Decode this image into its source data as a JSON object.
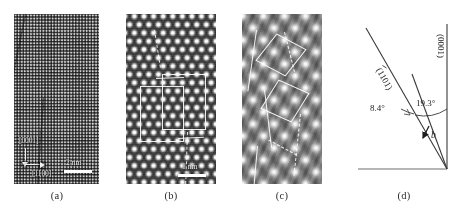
{
  "figure": {
    "panels": [
      {
        "id": "a",
        "caption": "(a)",
        "type": "hrtem-lattice-image",
        "annotations": {
          "direction_vertical": "[0001]",
          "direction_horizontal": "[1100]",
          "scalebar_label": "2 nm"
        }
      },
      {
        "id": "b",
        "caption": "(b)",
        "type": "hrtem-honeycomb-lattice-image",
        "annotations": {
          "scalebar_label": "1 nm"
        }
      },
      {
        "id": "c",
        "caption": "(c)",
        "type": "haadf-stem-atomic-columns-image",
        "annotations": {}
      },
      {
        "id": "d",
        "caption": "(d)",
        "type": "schematic-diagram",
        "annotations": {
          "plane_left": "(1101)",
          "plane_right": "(0001)",
          "angle_small": "8.4°",
          "angle_large": "19.3°",
          "burgers_vector": "b"
        }
      }
    ]
  },
  "colors": {
    "background": "#ffffff",
    "ink": "#1c1c1c",
    "annotation_white": "#ffffff",
    "caption": "#2b2b2b"
  }
}
